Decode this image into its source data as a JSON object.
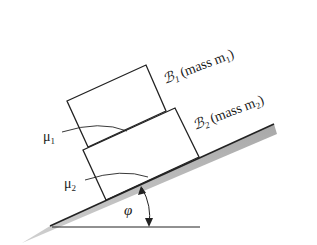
{
  "figure": {
    "type": "inclined-plane-stacked-blocks",
    "blocks": [
      {
        "id": "B1",
        "symbol": "ℬ",
        "subscript": "1",
        "label_text": "(mass m",
        "label_sub": "1",
        "label_close": ")"
      },
      {
        "id": "B2",
        "symbol": "ℬ",
        "subscript": "2",
        "label_text": "(mass m",
        "label_sub": "2",
        "label_close": ")"
      }
    ],
    "friction": [
      {
        "symbol": "μ",
        "subscript": "1"
      },
      {
        "symbol": "μ",
        "subscript": "2"
      }
    ],
    "angle": {
      "symbol": "φ"
    },
    "colors": {
      "line": "#222222",
      "ground_shade": "#b5b5b5",
      "background": "#ffffff"
    }
  }
}
